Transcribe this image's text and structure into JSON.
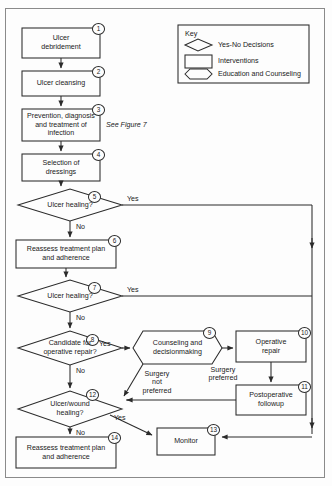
{
  "figure": {
    "see_reference": "See Figure 7"
  },
  "key": {
    "title": "Key",
    "entries": [
      {
        "shape": "diamond",
        "label": "Yes-No Decisions"
      },
      {
        "shape": "rectangle",
        "label": "Interventions"
      },
      {
        "shape": "hexagon",
        "label": "Education and Counseling"
      }
    ]
  },
  "nodes": [
    {
      "id": "1",
      "type": "intervention",
      "label": "Ulcer\ndebridement"
    },
    {
      "id": "2",
      "type": "intervention",
      "label": "Ulcer cleansing"
    },
    {
      "id": "3",
      "type": "intervention",
      "label": "Prevention, diagnosis\nand treatment of\ninfection"
    },
    {
      "id": "4",
      "type": "intervention",
      "label": "Selection of\ndressings"
    },
    {
      "id": "5",
      "type": "decision",
      "label": "Ulcer healing?"
    },
    {
      "id": "6",
      "type": "intervention",
      "label": "Reassess treatment plan\nand adherence"
    },
    {
      "id": "7",
      "type": "decision",
      "label": "Ulcer healing?"
    },
    {
      "id": "8",
      "type": "decision",
      "label": "Candidate for\noperative repair?"
    },
    {
      "id": "9",
      "type": "education",
      "label": "Counseling and\ndecisionmaking"
    },
    {
      "id": "10",
      "type": "intervention",
      "label": "Operative\nrepair"
    },
    {
      "id": "11",
      "type": "intervention",
      "label": "Postoperative\nfollowup"
    },
    {
      "id": "12",
      "type": "decision",
      "label": "Ulcer/wound\nhealing?"
    },
    {
      "id": "13",
      "type": "intervention",
      "label": "Monitor"
    },
    {
      "id": "14",
      "type": "intervention",
      "label": "Reassess treatment plan\nand adherence"
    }
  ],
  "edge_labels": {
    "yes5": "Yes",
    "no5": "No",
    "yes7": "Yes",
    "no7": "No",
    "yes8": "Yes",
    "no8": "No",
    "yes12": "Yes",
    "no12": "No",
    "surgery_preferred": "Surgery\npreferred",
    "surgery_not_preferred": "Surgery\nnot\npreferred"
  },
  "edge_label_lines": {
    "surgery_preferred_l1": "Surgery",
    "surgery_preferred_l2": "preferred",
    "surgery_not_preferred_l1": "Surgery",
    "surgery_not_preferred_l2": "not",
    "surgery_not_preferred_l3": "preferred"
  },
  "node_text_lines": {
    "n1_l1": "Ulcer",
    "n1_l2": "debridement",
    "n2_l1": "Ulcer cleansing",
    "n3_l1": "Prevention, diagnosis",
    "n3_l2": "and treatment of",
    "n3_l3": "infection",
    "n4_l1": "Selection of",
    "n4_l2": "dressings",
    "n5_l1": "Ulcer healing?",
    "n6_l1": "Reassess treatment plan",
    "n6_l2": "and adherence",
    "n7_l1": "Ulcer healing?",
    "n8_l1": "Candidate for",
    "n8_l2": "operative repair?",
    "n9_l1": "Counseling and",
    "n9_l2": "decisionmaking",
    "n10_l1": "Operative",
    "n10_l2": "repair",
    "n11_l1": "Postoperative",
    "n11_l2": "followup",
    "n12_l1": "Ulcer/wound",
    "n12_l2": "healing?",
    "n13_l1": "Monitor",
    "n14_l1": "Reassess treatment plan",
    "n14_l2": "and adherence"
  },
  "colors": {
    "stroke": "#2b2b2b",
    "frame": "#8a8a8a",
    "background": "#fdfdfd",
    "text": "#1a1a1a"
  }
}
